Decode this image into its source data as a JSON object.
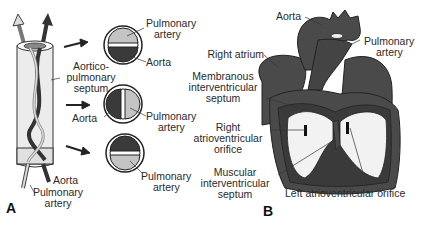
{
  "panel_a": {
    "letter": "A",
    "labels": {
      "pulmonary_artery_top_1": "Pulmonary",
      "pulmonary_artery_top_2": "artery",
      "aorta_top": "Aorta",
      "aorticopulmonary_1": "Aortico-",
      "aorticopulmonary_2": "pulmonary",
      "aorticopulmonary_3": "septum",
      "aorta_mid": "Aorta",
      "pulmonary_artery_mid_1": "Pulmonary",
      "pulmonary_artery_mid_2": "artery",
      "pulmonary_artery_bot_1": "Pulmonary",
      "pulmonary_artery_bot_2": "artery",
      "aorta_tube": "Aorta",
      "pulmonary_artery_tube_1": "Pulmonary",
      "pulmonary_artery_tube_2": "artery"
    }
  },
  "panel_b": {
    "letter": "B",
    "labels": {
      "aorta": "Aorta",
      "pulmonary_artery_1": "Pulmonary",
      "pulmonary_artery_2": "artery",
      "right_atrium": "Right atrium",
      "membranous_1": "Membranous",
      "membranous_2": "interventricular",
      "membranous_3": "septum",
      "right_av_1": "Right",
      "right_av_2": "atrioventricular",
      "right_av_3": "orifice",
      "muscular_1": "Muscular",
      "muscular_2": "interventricular",
      "muscular_3": "septum",
      "left_av": "Left atrioventricular orifice"
    }
  },
  "colors": {
    "dark": "#3a3a3a",
    "light": "#c4c4c4",
    "heart": "#4a4a4a",
    "heart_dark": "#333333",
    "chamber": "#f2f2f2"
  }
}
